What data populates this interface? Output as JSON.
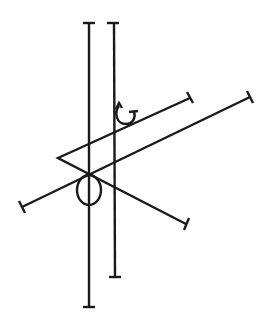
{
  "diagram": {
    "stroke_color": "#1a1a1a",
    "background": "#ffffff",
    "elements": [
      {
        "name": "vertical-rod-left",
        "type": "capped-line",
        "x1": 89,
        "y1": 23,
        "x2": 89,
        "y2": 307
      },
      {
        "name": "vertical-rod-right",
        "type": "capped-line",
        "x1": 114,
        "y1": 23,
        "x2": 115,
        "y2": 277
      },
      {
        "name": "diagonal-upper",
        "type": "capped-line",
        "x1": 58,
        "y1": 158,
        "x2": 190,
        "y2": 98
      },
      {
        "name": "diagonal-lower-short",
        "type": "capped-line",
        "x1": 58,
        "y1": 158,
        "x2": 186,
        "y2": 224
      },
      {
        "name": "diagonal-long",
        "type": "capped-line",
        "x1": 22,
        "y1": 207,
        "x2": 250,
        "y2": 97
      },
      {
        "name": "rotation-arrow",
        "type": "arc-arrow",
        "cx": 126,
        "cy": 115
      },
      {
        "name": "loop-ring",
        "type": "ellipse",
        "cx": 89,
        "cy": 190,
        "rx": 12,
        "ry": 15
      }
    ]
  }
}
